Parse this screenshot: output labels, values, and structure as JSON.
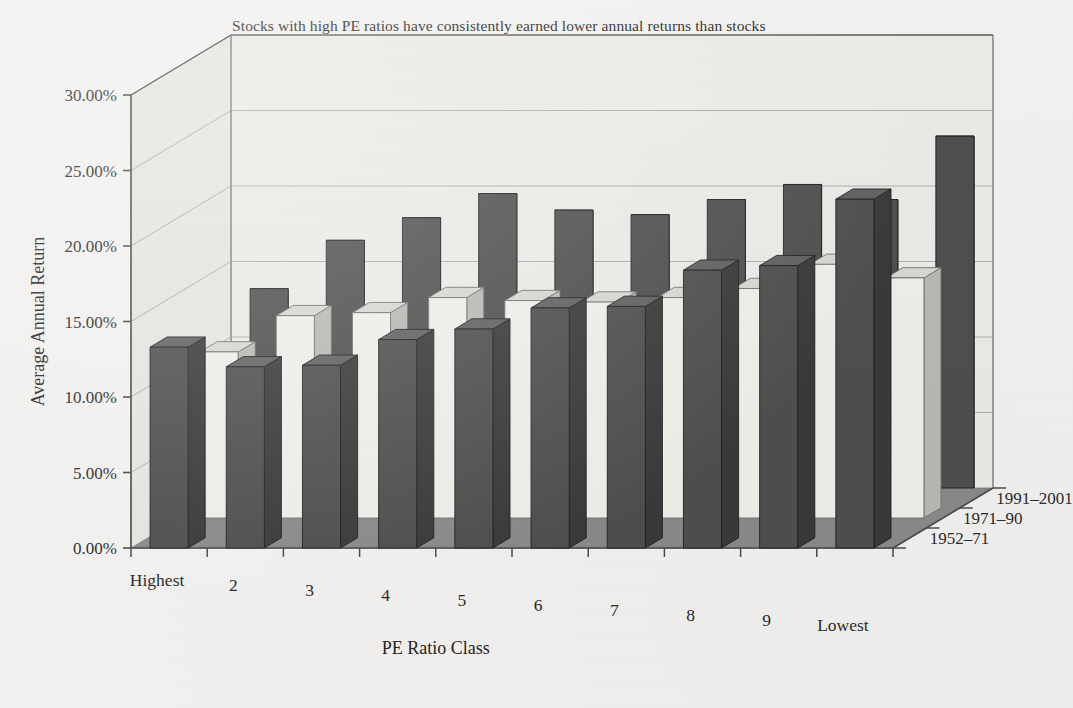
{
  "chart_data": {
    "type": "bar",
    "subtype": "3d-grouped-column",
    "title_line1": "Stocks with high PE ratios have consistently earned lower annual returns than stocks with low",
    "title_line2": "ratios.",
    "xlabel": "PE Ratio Class",
    "ylabel": "Average Annual Return",
    "zlabel": "",
    "categories": [
      "Highest",
      "2",
      "3",
      "4",
      "5",
      "6",
      "7",
      "8",
      "9",
      "Lowest"
    ],
    "ytick_labels": [
      "0.00%",
      "5.00%",
      "10.00%",
      "15.00%",
      "20.00%",
      "25.00%",
      "30.00%"
    ],
    "ytick_values": [
      0,
      5,
      10,
      15,
      20,
      25,
      30
    ],
    "ylim": [
      0,
      30
    ],
    "grid": true,
    "legend_position": "depth-axis-right",
    "series": [
      {
        "name": "1952–71",
        "color": "#4f4f4f",
        "depth_index": 0,
        "values": [
          13.3,
          12.0,
          12.1,
          13.8,
          14.5,
          15.9,
          16.0,
          18.4,
          18.7,
          23.1
        ]
      },
      {
        "name": "1971–90",
        "color": "#efeee9",
        "depth_index": 1,
        "values": [
          11.0,
          13.4,
          13.6,
          14.6,
          14.4,
          14.3,
          14.6,
          15.2,
          16.8,
          15.9
        ]
      },
      {
        "name": "1991–2001",
        "color": "#4f4f4f",
        "depth_index": 2,
        "values": [
          13.2,
          16.4,
          17.9,
          19.5,
          18.4,
          18.1,
          19.1,
          20.1,
          19.1,
          23.3
        ]
      }
    ]
  },
  "colors": {
    "background": "#f2f1ef",
    "floor": "#8a8a8a",
    "wall": "#eceae6",
    "wall_side": "#e6e4e0",
    "gridline": "#9b9b9b",
    "axis": "#4a4a4a",
    "bar_dark": "#4f4f4f",
    "bar_dark_side": "#3a3a3a",
    "bar_dark_top": "#616161",
    "bar_light": "#efeee9",
    "bar_light_side": "#b9b8b3",
    "bar_light_top": "#d8d7d2",
    "text": "#2b2b2b"
  }
}
